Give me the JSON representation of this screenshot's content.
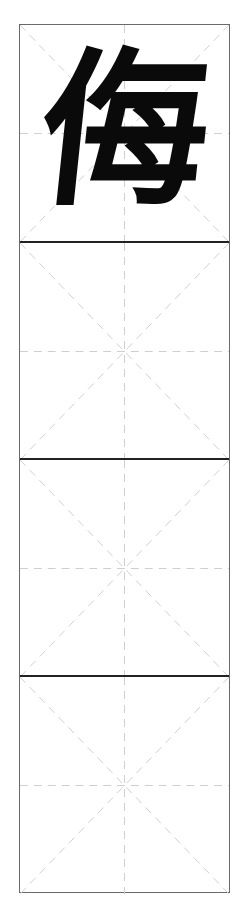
{
  "sheet": {
    "type": "mi-zi-ge practice grid",
    "cells": [
      {
        "character": "侮"
      },
      {
        "character": ""
      },
      {
        "character": ""
      },
      {
        "character": ""
      }
    ]
  },
  "colors": {
    "ink": "#0a0a0a",
    "border": "#6a6a6a",
    "divider": "#222222",
    "guide": "#c8c8c8"
  }
}
